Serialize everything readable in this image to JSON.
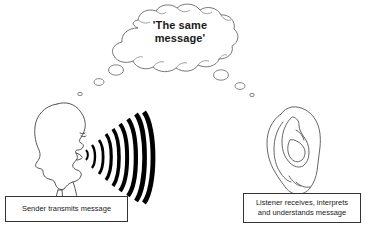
{
  "diagram": {
    "title_visible": false,
    "background_color": "#ffffff",
    "line_color": "#333333",
    "wave_color": "#000000",
    "text_color": "#222222"
  },
  "thought_bubble": {
    "name": "thought-bubble",
    "text_line1": "'The same",
    "text_line2": "message'",
    "full_text": "'The same message'",
    "trail_left": [
      "large-dot",
      "medium-dot",
      "small-dot"
    ],
    "trail_right": [
      "large-dot",
      "medium-dot",
      "small-dot"
    ]
  },
  "sender": {
    "figure": "head-profile-speaking",
    "caption": "Sender transmits message"
  },
  "sound_waves": {
    "name": "sound-wave-arcs",
    "arc_count": 9,
    "origin": "mouth"
  },
  "listener": {
    "figure": "ear",
    "caption_line1": "Listener receives, interprets",
    "caption_line2": "and understands message",
    "caption": "Listener receives, interprets and understands message"
  }
}
